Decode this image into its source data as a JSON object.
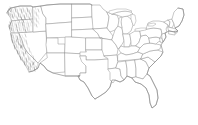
{
  "figure": {
    "title": "Contiguous United States state boundary map",
    "description": "Outline map of the lower 48 United States with thin gray state borders on a white background. Dense pencil-like hillshade hatching covers the Pacific Coast states, depicting the Coast Ranges, Cascade Range and Sierra Nevada mountains.",
    "width": 198,
    "height": 125,
    "background_color": "#ffffff",
    "border_color": "#9a9a9a",
    "relief_color": "#5e5e5e",
    "has_labels": false,
    "has_legend": false,
    "has_title_text": false,
    "projection_appearance": "albers-equal-area-conic"
  },
  "map": {
    "region_name": "Contiguous United States",
    "state_count": 49,
    "shaded_region_label": "Pacific Coast mountain relief",
    "shaded_states": [
      "Washington",
      "Oregon",
      "California",
      "Nevada",
      "Idaho"
    ],
    "states": [
      "Washington",
      "Oregon",
      "California",
      "Nevada",
      "Idaho",
      "Montana",
      "Wyoming",
      "Utah",
      "Arizona",
      "Colorado",
      "New Mexico",
      "North Dakota",
      "South Dakota",
      "Nebraska",
      "Kansas",
      "Oklahoma",
      "Texas",
      "Minnesota",
      "Iowa",
      "Missouri",
      "Arkansas",
      "Louisiana",
      "Wisconsin",
      "Illinois",
      "Michigan",
      "Indiana",
      "Ohio",
      "Kentucky",
      "Tennessee",
      "Mississippi",
      "Alabama",
      "Georgia",
      "Florida",
      "South Carolina",
      "North Carolina",
      "Virginia",
      "West Virginia",
      "Maryland",
      "Delaware",
      "Pennsylvania",
      "New Jersey",
      "New York",
      "Connecticut",
      "Rhode Island",
      "Massachusetts",
      "Vermont",
      "New Hampshire",
      "Maine",
      "District of Columbia"
    ],
    "great_lakes": [
      "Lake Superior",
      "Lake Michigan",
      "Lake Huron",
      "Lake Erie",
      "Lake Ontario"
    ]
  }
}
